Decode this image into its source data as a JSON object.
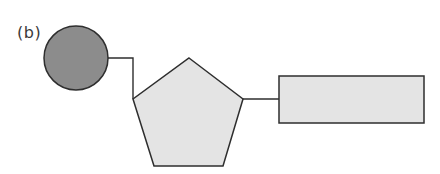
{
  "figure": {
    "label": "(b)"
  },
  "shapes": {
    "circle": {
      "cx": 76,
      "cy": 58,
      "r": 32,
      "fill": "#8c8c8c",
      "stroke": "#2e2e2e"
    },
    "pentagon": {
      "points": "189,58 243,99 223,166 154,166 133,99",
      "fill": "#e4e4e4",
      "stroke": "#2e2e2e"
    },
    "rectangle": {
      "x": 279,
      "y": 76,
      "width": 145,
      "height": 47,
      "fill": "#e4e4e4",
      "stroke": "#2e2e2e"
    }
  },
  "connectors": [
    {
      "from": "circle",
      "to": "pentagon",
      "points": "108,58 133,58 133,99",
      "stroke": "#2e2e2e"
    },
    {
      "from": "pentagon",
      "to": "rectangle",
      "points": "243,99 279,99",
      "stroke": "#2e2e2e"
    }
  ]
}
